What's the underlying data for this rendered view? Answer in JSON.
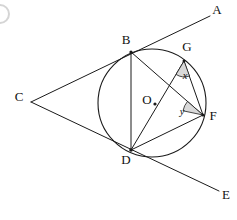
{
  "figure": {
    "background_color": "#ffffff",
    "ink_color": "#1a1a1a",
    "wedge_fill_color": "#d9d9d9"
  },
  "circle": {
    "center_label": "O",
    "center_x": 152,
    "center_y": 103,
    "radius": 54
  },
  "points": [
    {
      "id": "A",
      "label": "A",
      "label_x": 217,
      "label_y": 11,
      "x": 210,
      "y": 16,
      "on_circle": false
    },
    {
      "id": "B",
      "label": "B",
      "label_x": 126,
      "label_y": 41,
      "x": 131,
      "y": 52,
      "on_circle": true
    },
    {
      "id": "C",
      "label": "C",
      "label_x": 19,
      "label_y": 98,
      "x": 31,
      "y": 102,
      "on_circle": false
    },
    {
      "id": "D",
      "label": "D",
      "label_x": 126,
      "label_y": 161,
      "x": 131,
      "y": 150,
      "on_circle": true
    },
    {
      "id": "E",
      "label": "E",
      "label_x": 226,
      "label_y": 196,
      "x": 219,
      "y": 191,
      "on_circle": false
    },
    {
      "id": "F",
      "label": "F",
      "label_x": 213,
      "label_y": 117,
      "x": 203,
      "y": 115,
      "on_circle": true
    },
    {
      "id": "G",
      "label": "G",
      "label_x": 187,
      "label_y": 48,
      "x": 184,
      "y": 61,
      "on_circle": true
    },
    {
      "id": "O",
      "label": "O",
      "label_x": 147,
      "label_y": 101,
      "x": 155,
      "y": 104,
      "on_circle": false
    }
  ],
  "segments": [
    {
      "name": "tangent-line-C-B-A",
      "from": "C",
      "to": "A",
      "kind": "tangent"
    },
    {
      "name": "tangent-line-C-D-E",
      "from": "C",
      "to": "E",
      "kind": "tangent"
    },
    {
      "name": "chord-B-D",
      "from": "B",
      "to": "D",
      "kind": "chord"
    },
    {
      "name": "chord-B-F",
      "from": "B",
      "to": "F",
      "kind": "chord"
    },
    {
      "name": "chord-D-G",
      "from": "D",
      "to": "G",
      "kind": "chord"
    },
    {
      "name": "chord-D-F",
      "from": "D",
      "to": "F",
      "kind": "chord"
    },
    {
      "name": "chord-G-F",
      "from": "G",
      "to": "F",
      "kind": "chord"
    }
  ],
  "angles": [
    {
      "id": "x",
      "label": "x",
      "vertex": "G",
      "label_x": 185,
      "label_y": 77,
      "description": "angle at G between GD and GF"
    },
    {
      "id": "y",
      "label": "y",
      "vertex": "F",
      "label_x": 182,
      "label_y": 113,
      "description": "angle at F between FB and FD"
    }
  ]
}
